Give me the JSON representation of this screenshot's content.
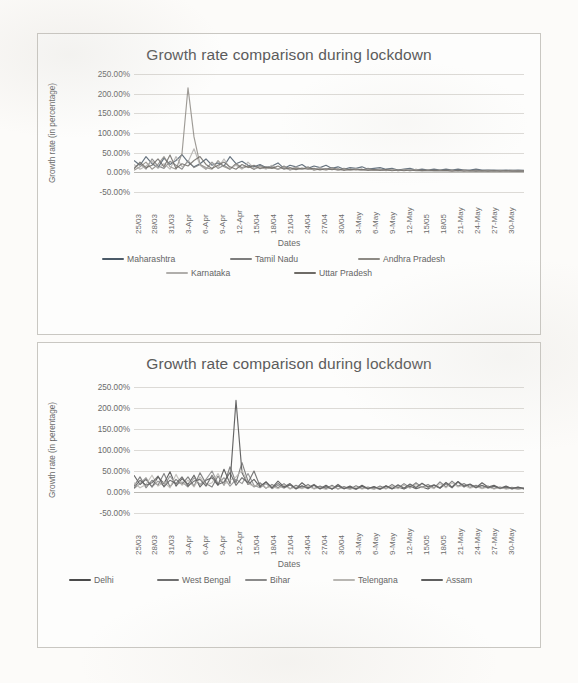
{
  "page": {
    "background_color": "#fcfbf9",
    "card_border_color": "#c9c7c2"
  },
  "charts": [
    {
      "id": "chart-1",
      "title": "Growth rate comparison during lockdown",
      "xlabel": "Dates",
      "ylabel": "Growth rate (in percentage)"
    },
    {
      "id": "chart-2",
      "title": "Growth rate comparison during lockdown",
      "xlabel": "Dates",
      "ylabel": "Growth rate (in perentage)"
    }
  ],
  "chart_data": [
    {
      "type": "line",
      "title": "Growth rate comparison during lockdown",
      "xlabel": "Dates",
      "ylabel": "Growth rate (in percentage)",
      "ylim": [
        -50,
        250
      ],
      "ytick_labels": [
        "250.00%",
        "200.00%",
        "150.00%",
        "100.00%",
        "50.00%",
        "0.00%",
        "-50.00%"
      ],
      "yticks": [
        250,
        200,
        150,
        100,
        50,
        0,
        -50
      ],
      "grid": true,
      "legend_position": "bottom",
      "categories": [
        "25/03",
        "28/03",
        "31/03",
        "3-Apr",
        "6-Apr",
        "9-Apr",
        "12-Apr",
        "15/04",
        "18/04",
        "21/04",
        "24/04",
        "27/04",
        "30/04",
        "3-May",
        "6-May",
        "9-May",
        "12-May",
        "15/05",
        "18/05",
        "21-May",
        "24-May",
        "27-May",
        "30-May"
      ],
      "x_tick_every": 3,
      "series": [
        {
          "name": "Maharashtra",
          "color": "#4b5a68",
          "values": [
            30,
            18,
            40,
            22,
            12,
            36,
            20,
            30,
            45,
            26,
            14,
            22,
            34,
            18,
            24,
            16,
            40,
            22,
            28,
            18,
            14,
            20,
            12,
            16,
            24,
            10,
            18,
            14,
            20,
            10,
            16,
            12,
            18,
            10,
            14,
            8,
            12,
            10,
            14,
            8,
            10,
            12,
            8,
            10,
            6,
            8,
            10,
            6,
            8,
            6,
            8,
            6,
            8,
            6,
            8,
            6,
            6,
            8,
            6,
            6,
            6,
            5,
            6,
            5,
            6,
            5
          ]
        },
        {
          "name": "Tamil Nadu",
          "color": "#7d7d7d",
          "values": [
            12,
            22,
            8,
            34,
            16,
            10,
            28,
            18,
            8,
            30,
            12,
            20,
            8,
            26,
            10,
            18,
            8,
            22,
            12,
            16,
            8,
            18,
            10,
            14,
            8,
            16,
            8,
            12,
            8,
            14,
            6,
            10,
            8,
            12,
            6,
            10,
            6,
            8,
            6,
            10,
            6,
            8,
            5,
            8,
            5,
            7,
            5,
            8,
            5,
            6,
            5,
            6,
            5,
            6,
            4,
            6,
            4,
            5,
            4,
            5,
            4,
            5,
            4,
            5,
            4,
            4
          ]
        },
        {
          "name": "Andhra Pradesh",
          "color": "#8d8a84",
          "values": [
            5,
            14,
            26,
            8,
            20,
            40,
            14,
            8,
            48,
            215,
            90,
            20,
            12,
            8,
            30,
            14,
            8,
            22,
            10,
            16,
            8,
            14,
            10,
            12,
            8,
            14,
            6,
            10,
            8,
            12,
            6,
            8,
            6,
            10,
            6,
            8,
            6,
            8,
            5,
            8,
            5,
            7,
            5,
            7,
            4,
            6,
            4,
            6,
            4,
            6,
            4,
            5,
            4,
            5,
            4,
            5,
            4,
            5,
            3,
            4,
            3,
            4,
            3,
            4,
            3,
            4
          ]
        },
        {
          "name": "Karnataka",
          "color": "#b0aeab",
          "values": [
            20,
            8,
            16,
            28,
            10,
            22,
            8,
            40,
            14,
            26,
            60,
            18,
            8,
            24,
            12,
            34,
            10,
            18,
            8,
            26,
            10,
            14,
            8,
            18,
            8,
            12,
            6,
            14,
            8,
            10,
            6,
            12,
            6,
            9,
            5,
            8,
            5,
            9,
            5,
            7,
            5,
            8,
            4,
            7,
            4,
            6,
            4,
            6,
            4,
            5,
            4,
            5,
            4,
            5,
            3,
            5,
            3,
            4,
            3,
            4,
            3,
            4,
            3,
            4,
            3,
            3
          ]
        },
        {
          "name": "Uttar Pradesh",
          "color": "#6e6b66",
          "values": [
            8,
            26,
            12,
            18,
            34,
            14,
            44,
            10,
            22,
            16,
            30,
            40,
            20,
            10,
            18,
            26,
            14,
            8,
            20,
            12,
            18,
            9,
            14,
            10,
            16,
            8,
            12,
            7,
            11,
            8,
            10,
            6,
            9,
            7,
            9,
            5,
            8,
            6,
            8,
            5,
            7,
            5,
            7,
            4,
            6,
            4,
            6,
            4,
            5,
            4,
            5,
            4,
            5,
            3,
            5,
            3,
            4,
            3,
            4,
            3,
            4,
            3,
            4,
            3,
            3,
            3
          ]
        }
      ]
    },
    {
      "type": "line",
      "title": "Growth rate comparison during lockdown",
      "xlabel": "Dates",
      "ylabel": "Growth rate (in perentage)",
      "ylim": [
        -50,
        250
      ],
      "ytick_labels": [
        "250.00%",
        "200.00%",
        "150.00%",
        "100.00%",
        "50.00%",
        "0.00%",
        "-50.00%"
      ],
      "yticks": [
        250,
        200,
        150,
        100,
        50,
        0,
        -50
      ],
      "grid": true,
      "legend_position": "bottom",
      "categories": [
        "25/03",
        "28/03",
        "31/03",
        "3-Apr",
        "6-Apr",
        "9-Apr",
        "12-Apr",
        "15/04",
        "18/04",
        "21/04",
        "24/04",
        "27/04",
        "30/04",
        "3-May",
        "6-May",
        "9-May",
        "12-May",
        "15/05",
        "18/05",
        "21-May",
        "24-May",
        "27-May",
        "30-May"
      ],
      "x_tick_every": 3,
      "series": [
        {
          "name": "Delhi",
          "color": "#4a4a4a",
          "values": [
            40,
            18,
            30,
            12,
            36,
            20,
            48,
            14,
            32,
            18,
            40,
            12,
            28,
            34,
            16,
            54,
            20,
            218,
            46,
            18,
            30,
            12,
            24,
            10,
            26,
            12,
            20,
            8,
            22,
            10,
            18,
            8,
            16,
            7,
            18,
            8,
            14,
            7,
            16,
            8,
            13,
            7,
            15,
            8,
            12,
            7,
            14,
            8,
            12,
            7,
            16,
            9,
            20,
            10,
            24,
            12,
            18,
            10,
            22,
            12,
            16,
            9,
            14,
            8,
            12,
            8
          ]
        },
        {
          "name": "West Bengal",
          "color": "#6f6f6f",
          "values": [
            14,
            36,
            10,
            28,
            16,
            44,
            12,
            30,
            18,
            36,
            14,
            46,
            20,
            12,
            38,
            16,
            60,
            22,
            70,
            26,
            12,
            22,
            9,
            18,
            10,
            20,
            8,
            16,
            9,
            18,
            8,
            14,
            8,
            16,
            7,
            13,
            7,
            15,
            8,
            12,
            7,
            14,
            8,
            18,
            9,
            20,
            10,
            22,
            11,
            18,
            9,
            24,
            12,
            26,
            14,
            20,
            11,
            16,
            9,
            14,
            8,
            12,
            8,
            11,
            7,
            10
          ]
        },
        {
          "name": "Bihar",
          "color": "#8a8a8a",
          "values": [
            8,
            20,
            34,
            12,
            26,
            14,
            38,
            18,
            24,
            12,
            34,
            18,
            30,
            50,
            20,
            34,
            14,
            30,
            20,
            44,
            16,
            10,
            20,
            8,
            16,
            9,
            18,
            7,
            14,
            8,
            16,
            7,
            12,
            7,
            14,
            8,
            11,
            6,
            13,
            7,
            11,
            6,
            13,
            7,
            16,
            9,
            18,
            10,
            20,
            11,
            16,
            9,
            22,
            11,
            24,
            13,
            18,
            10,
            15,
            9,
            13,
            8,
            11,
            7,
            10,
            7
          ]
        },
        {
          "name": "Telengana",
          "color": "#b8b6b2",
          "values": [
            22,
            10,
            18,
            40,
            14,
            24,
            10,
            42,
            16,
            28,
            12,
            36,
            16,
            22,
            44,
            18,
            28,
            36,
            52,
            20,
            14,
            18,
            10,
            14,
            8,
            16,
            7,
            12,
            8,
            14,
            7,
            11,
            6,
            13,
            7,
            10,
            6,
            12,
            7,
            10,
            6,
            12,
            7,
            14,
            8,
            16,
            9,
            18,
            10,
            14,
            8,
            20,
            10,
            22,
            12,
            16,
            9,
            13,
            8,
            12,
            7,
            10,
            7,
            9,
            6,
            9
          ]
        },
        {
          "name": "Assam",
          "color": "#5f5f5f",
          "values": [
            10,
            28,
            16,
            22,
            38,
            12,
            28,
            20,
            36,
            14,
            26,
            30,
            14,
            40,
            18,
            24,
            46,
            16,
            34,
            22,
            50,
            14,
            24,
            10,
            20,
            11,
            17,
            8,
            15,
            9,
            16,
            8,
            13,
            7,
            15,
            8,
            12,
            7,
            14,
            8,
            12,
            7,
            14,
            8,
            17,
            9,
            19,
            11,
            21,
            12,
            17,
            10,
            23,
            12,
            25,
            14,
            19,
            11,
            16,
            10,
            14,
            9,
            12,
            8,
            11,
            8
          ]
        }
      ]
    }
  ]
}
